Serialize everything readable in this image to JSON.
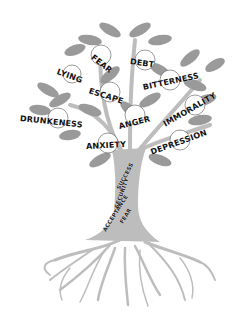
{
  "fruits": [
    {
      "label": "FEAR",
      "x": 92,
      "y": 56,
      "rot": 38
    },
    {
      "label": "DEBT",
      "x": 130,
      "y": 60,
      "rot": 8
    },
    {
      "label": "LYING",
      "x": 57,
      "y": 72,
      "rot": 20
    },
    {
      "label": "BITTERNESS",
      "x": 143,
      "y": 82,
      "rot": -12
    },
    {
      "label": "ESCAPE",
      "x": 89,
      "y": 91,
      "rot": 18
    },
    {
      "label": "IMMORALITY",
      "x": 164,
      "y": 112,
      "rot": -30
    },
    {
      "label": "DRUNKENESS",
      "x": 20,
      "y": 119,
      "rot": 6
    },
    {
      "label": "ANGER",
      "x": 119,
      "y": 122,
      "rot": -14
    },
    {
      "label": "ANXIETY",
      "x": 86,
      "y": 145,
      "rot": -3
    },
    {
      "label": "DEPRESSION",
      "x": 151,
      "y": 146,
      "rot": -20
    }
  ],
  "roots_labels": [
    {
      "label": "SUCCESS",
      "x": 118,
      "y": 180,
      "rot": -62
    },
    {
      "label": "SECURITY",
      "x": 118,
      "y": 202,
      "rot": -70
    },
    {
      "label": "ACCEPTANCE",
      "x": 104,
      "y": 230,
      "rot": -58
    },
    {
      "label": "FEAR",
      "x": 121,
      "y": 220,
      "rot": -58
    }
  ],
  "colors": {
    "leaf": "#9a9a9a",
    "leaf_dark": "#7d7d7d",
    "trunk": "#bdbdbd",
    "text": "#111111"
  }
}
